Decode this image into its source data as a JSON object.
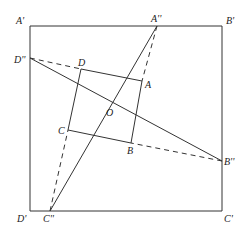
{
  "diagram": {
    "colors": {
      "line": "#333333",
      "text": "#222222",
      "background": "#ffffff"
    },
    "outer_square": {
      "vertices": [
        {
          "name": "A'",
          "x": 30,
          "y": 26,
          "label_x": 16,
          "label_y": 24
        },
        {
          "name": "B'",
          "x": 222,
          "y": 26,
          "label_x": 226,
          "label_y": 24
        },
        {
          "name": "C'",
          "x": 222,
          "y": 211,
          "label_x": 224,
          "label_y": 222
        },
        {
          "name": "D'",
          "x": 30,
          "y": 211,
          "label_x": 17,
          "label_y": 222
        }
      ]
    },
    "inner_square": {
      "vertices": [
        {
          "name": "A",
          "x": 142,
          "y": 81,
          "label_x": 145,
          "label_y": 88
        },
        {
          "name": "B",
          "x": 131,
          "y": 143,
          "label_x": 127,
          "label_y": 154
        },
        {
          "name": "C",
          "x": 68,
          "y": 130,
          "label_x": 58,
          "label_y": 134
        },
        {
          "name": "D",
          "x": 81,
          "y": 69,
          "label_x": 78,
          "label_y": 66
        }
      ]
    },
    "center": {
      "name": "O",
      "x": 111,
      "y": 102,
      "label_x": 106,
      "label_y": 116
    },
    "projected_points": [
      {
        "name": "A''",
        "x": 157,
        "y": 26,
        "label_x": 151,
        "label_y": 22
      },
      {
        "name": "B''",
        "x": 222,
        "y": 161,
        "label_x": 224,
        "label_y": 165
      },
      {
        "name": "C''",
        "x": 50,
        "y": 211,
        "label_x": 43,
        "label_y": 222
      },
      {
        "name": "D''",
        "x": 30,
        "y": 58,
        "label_x": 14,
        "label_y": 63
      }
    ],
    "solid_lines": [
      {
        "from": "D''",
        "to": "B''"
      },
      {
        "from": "A''",
        "to": "C''"
      }
    ],
    "dashed_lines": [
      {
        "from": "D''",
        "to": "D"
      },
      {
        "from": "A''",
        "to": "A"
      },
      {
        "from": "B''",
        "to": "B"
      },
      {
        "from": "C''",
        "to": "C"
      }
    ]
  }
}
